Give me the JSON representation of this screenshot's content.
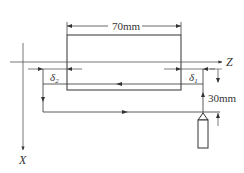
{
  "diagram": {
    "type": "turning-toolpath-schematic",
    "workpiece_length_label": "70mm",
    "retract_distance_label": "30mm",
    "axis_z_label": "Z",
    "axis_x_label": "X",
    "delta1_label": "δ",
    "delta1_sub": "1",
    "delta2_label": "δ",
    "delta2_sub": "2",
    "colors": {
      "line": "#333333",
      "background": "#ffffff",
      "axis": "#555555"
    }
  }
}
